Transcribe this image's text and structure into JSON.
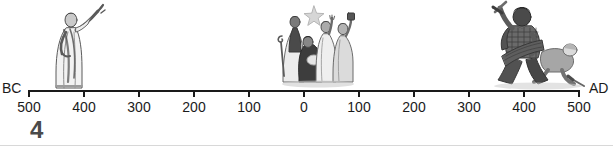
{
  "caption": {
    "text": "of the timeline."
  },
  "timeline": {
    "era_left_label": "BC",
    "era_right_label": "AD",
    "axis_color": "#1a1a1a",
    "ticks": [
      {
        "label": "500",
        "era": "BC",
        "x": 29
      },
      {
        "label": "400",
        "era": "BC",
        "x": 84
      },
      {
        "label": "300",
        "era": "BC",
        "x": 139
      },
      {
        "label": "200",
        "era": "BC",
        "x": 194
      },
      {
        "label": "100",
        "era": "BC",
        "x": 249
      },
      {
        "label": "0",
        "era": "",
        "x": 304
      },
      {
        "label": "100",
        "era": "AD",
        "x": 359
      },
      {
        "label": "200",
        "era": "AD",
        "x": 414
      },
      {
        "label": "300",
        "era": "AD",
        "x": 469
      },
      {
        "label": "400",
        "era": "AD",
        "x": 524
      },
      {
        "label": "500",
        "era": "AD",
        "x": 579
      }
    ]
  },
  "illustrations": [
    {
      "name": "prophet-figure",
      "description": "Robed prophet standing with one arm raised",
      "x": 44,
      "y": 2,
      "width": 62,
      "height": 90
    },
    {
      "name": "nativity-scene",
      "description": "Nativity scene with star, shepherds and wise men around the manger",
      "x": 268,
      "y": 2,
      "width": 92,
      "height": 90
    },
    {
      "name": "barbarian-warrior",
      "description": "Barbarian warrior with raised sword and shield standing over a fallen soldier",
      "x": 486,
      "y": 0,
      "width": 100,
      "height": 92
    }
  ],
  "page": {
    "number": "4"
  }
}
